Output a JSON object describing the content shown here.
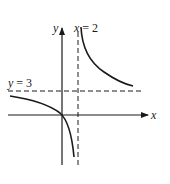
{
  "diagram": {
    "type": "function-graph",
    "labels": {
      "y_axis": "y",
      "x_axis": "x",
      "vertical_asymptote_var": "x",
      "vertical_asymptote_eq": "= 2",
      "horizontal_asymptote_var": "y",
      "horizontal_asymptote_eq": "= 3"
    },
    "asymptotes": {
      "vertical": "x = 2",
      "horizontal": "y = 3"
    },
    "colors": {
      "ink": "#1a1a1a",
      "background": "#ffffff"
    }
  }
}
